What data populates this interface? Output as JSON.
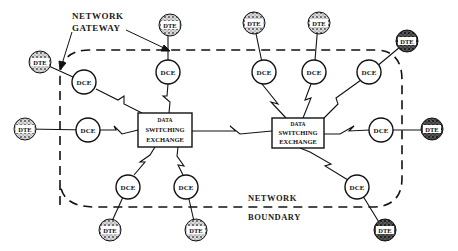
{
  "labels": {
    "gateway_line1": "NETWORK",
    "gateway_line2": "GATEWAY",
    "boundary_line1": "NETWORK",
    "boundary_line2": "BOUNDARY"
  },
  "exchanges": [
    {
      "id": "left",
      "lines": [
        "DATA",
        "SWITCHING",
        "EXCHANGE"
      ]
    },
    {
      "id": "right",
      "lines": [
        "DATA",
        "SWITCHING",
        "EXCHANGE"
      ]
    }
  ],
  "node_labels": {
    "dce": "DCE",
    "dte": "DTE"
  },
  "colors": {
    "ink": "#111111",
    "background": "#ffffff",
    "dte_fill": "#9a9a9a"
  }
}
